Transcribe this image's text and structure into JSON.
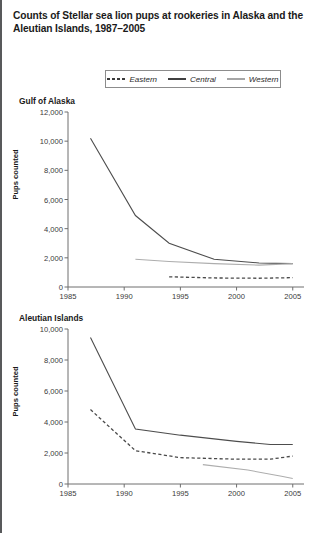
{
  "figure": {
    "title": "Counts of Stellar sea lion pups at rookeries in Alaska and the Aleutian Islands, 1987–2005"
  },
  "legend": {
    "position": "top-center",
    "items": [
      {
        "label": "Eastern",
        "style": "dashed",
        "color": "#4a4a4a"
      },
      {
        "label": "Central",
        "style": "solid",
        "color": "#4d4d4d"
      },
      {
        "label": "Western",
        "style": "solid",
        "color": "#adadad"
      }
    ]
  },
  "chart_data": [
    {
      "type": "line",
      "title": "Gulf of Alaska",
      "xlabel": "",
      "ylabel": "Pups counted",
      "xlim": [
        1985,
        2006
      ],
      "ylim": [
        0,
        12000
      ],
      "xticks": [
        1985,
        1990,
        1995,
        2000,
        2005
      ],
      "xticklabels": [
        "1985",
        "1990",
        "1995",
        "2000",
        "2005"
      ],
      "yticks": [
        0,
        2000,
        4000,
        6000,
        8000,
        10000,
        12000
      ],
      "yticklabels": [
        "0",
        "2,000",
        "4,000",
        "6,000",
        "8,000",
        "10,000",
        "12,000"
      ],
      "grid": false,
      "series": [
        {
          "name": "Central",
          "x": [
            1987,
            1991,
            1994,
            1998,
            2002,
            2005
          ],
          "values": [
            10200,
            4900,
            3000,
            1900,
            1650,
            1600
          ]
        },
        {
          "name": "Western",
          "x": [
            1991,
            1994,
            1998,
            2002,
            2005
          ],
          "values": [
            1900,
            1750,
            1600,
            1500,
            1600
          ]
        },
        {
          "name": "Eastern",
          "x": [
            1994,
            1998,
            2002,
            2005
          ],
          "values": [
            700,
            620,
            600,
            640
          ]
        }
      ]
    },
    {
      "type": "line",
      "title": "Aleutian Islands",
      "xlabel": "",
      "ylabel": "Pups counted",
      "xlim": [
        1985,
        2006
      ],
      "ylim": [
        0,
        10000
      ],
      "xticks": [
        1985,
        1990,
        1995,
        2000,
        2005
      ],
      "xticklabels": [
        "1985",
        "1990",
        "1995",
        "2000",
        "2005"
      ],
      "yticks": [
        0,
        2000,
        4000,
        6000,
        8000,
        10000
      ],
      "yticklabels": [
        "0",
        "2,000",
        "4,000",
        "6,000",
        "8,000",
        "10,000"
      ],
      "grid": false,
      "series": [
        {
          "name": "Central",
          "x": [
            1987,
            1991,
            1995,
            2000,
            2003,
            2005
          ],
          "values": [
            9450,
            3550,
            3150,
            2750,
            2550,
            2550
          ]
        },
        {
          "name": "Eastern",
          "x": [
            1987,
            1991,
            1995,
            2000,
            2003,
            2005
          ],
          "values": [
            4800,
            2150,
            1700,
            1600,
            1600,
            1800
          ]
        },
        {
          "name": "Western",
          "x": [
            1997,
            2001,
            2004,
            2005
          ],
          "values": [
            1250,
            900,
            500,
            350
          ]
        }
      ]
    }
  ]
}
